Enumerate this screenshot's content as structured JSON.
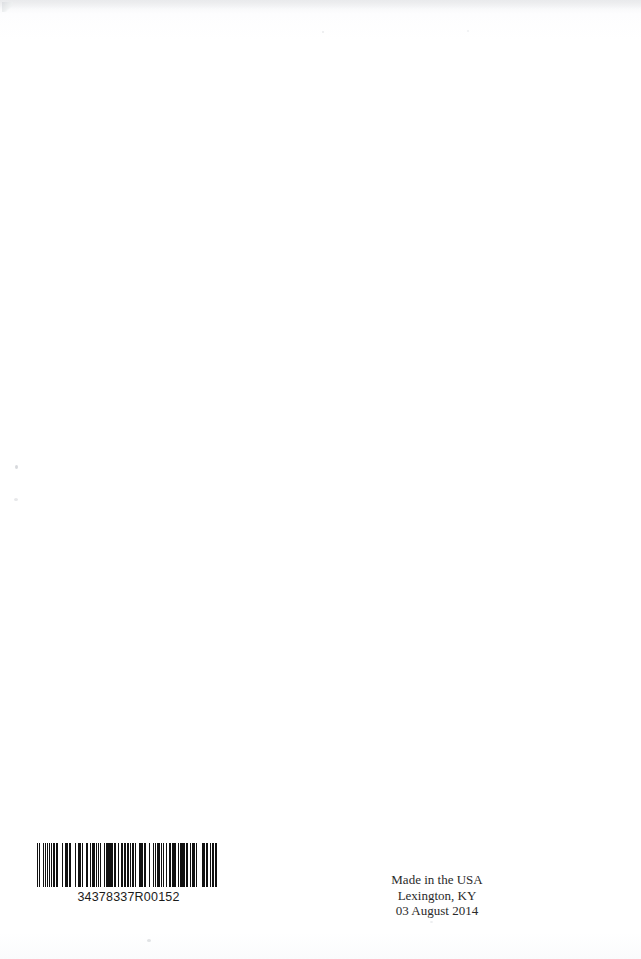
{
  "page": {
    "kind": "scanned-book-back-cover",
    "background_color": "#ffffff",
    "ink_color": "#111111",
    "width": 641,
    "height": 959
  },
  "barcode": {
    "symbology": "Code 128",
    "human_readable_number": "34378337R00152",
    "bar_color": "#111111",
    "background_color": "#ffffff",
    "module_pattern": [
      2,
      1,
      1,
      2,
      1,
      3,
      1,
      1,
      3,
      1,
      2,
      1,
      1,
      2,
      2,
      1,
      3,
      2,
      1,
      1,
      1,
      3,
      1,
      2,
      2,
      1,
      1,
      1,
      3,
      1,
      1,
      2,
      3,
      1,
      1,
      2,
      1,
      1,
      2,
      3,
      1,
      1,
      3,
      2,
      1,
      1,
      1,
      2,
      2,
      1,
      1,
      3,
      2,
      1,
      3,
      1,
      1,
      2,
      1,
      1,
      2,
      2,
      1,
      3,
      1,
      1,
      1,
      2,
      3,
      1,
      2,
      1,
      1,
      1,
      2,
      2,
      3,
      1,
      1,
      2,
      1,
      3,
      1,
      1,
      2,
      1,
      3,
      2,
      1,
      1,
      1,
      2,
      1,
      1,
      3,
      2,
      2,
      1,
      1,
      3,
      1,
      1,
      2,
      1,
      1,
      2,
      3,
      1,
      1,
      2,
      2,
      1,
      1,
      3,
      1,
      2,
      2,
      1,
      3,
      1,
      1,
      1,
      2,
      2,
      1,
      3,
      2,
      1,
      1,
      1,
      3,
      2,
      1,
      1,
      2,
      1,
      1,
      3,
      2,
      1,
      3,
      1,
      1,
      1,
      2,
      2,
      1,
      1,
      2,
      3,
      1,
      2,
      1,
      1,
      3,
      1,
      2,
      2,
      1,
      1,
      1,
      3,
      2,
      1,
      1,
      2,
      3,
      1,
      1,
      1,
      2,
      1,
      3,
      2,
      1,
      1,
      2,
      1
    ]
  },
  "imprint": {
    "lines": [
      "Made in the USA",
      "Lexington, KY",
      "03 August 2014"
    ],
    "line1": "Made in the USA",
    "line2": "Lexington, KY",
    "line3": "03 August 2014"
  }
}
